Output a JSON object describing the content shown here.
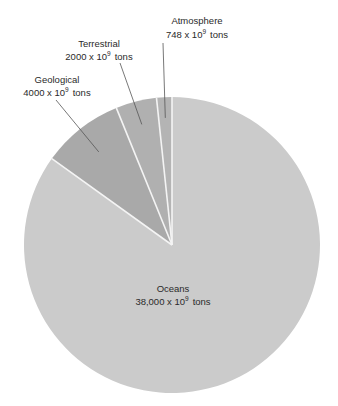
{
  "chart_data": {
    "type": "pie",
    "title": "",
    "unit": "x 10^9 tons",
    "start": "top",
    "direction": "counterclockwise",
    "slices": [
      {
        "name": "Atmosphere",
        "value": 748,
        "label_line1": "Atmosphere",
        "label_value": "748 x 10",
        "label_exp": "9",
        "label_unit": "tons",
        "color": "#b4b4b4"
      },
      {
        "name": "Terrestrial",
        "value": 2000,
        "label_line1": "Terrestrial",
        "label_value": "2000 x 10",
        "label_exp": "9",
        "label_unit": "tons",
        "color": "#b0b0b0"
      },
      {
        "name": "Geological",
        "value": 4000,
        "label_line1": "Geological",
        "label_value": "4000 x 10",
        "label_exp": "9",
        "label_unit": "tons",
        "color": "#a9a9a9"
      },
      {
        "name": "Oceans",
        "value": 38000,
        "label_line1": "Oceans",
        "label_value": "38,000 x 10",
        "label_exp": "9",
        "label_unit": "tons",
        "color": "#cbcbcb"
      }
    ],
    "separator_color": "#f4f4f4",
    "leader_color": "#555555"
  }
}
